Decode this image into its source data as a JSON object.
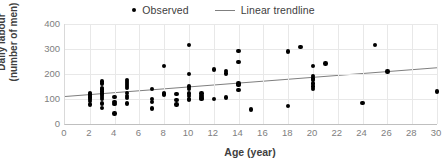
{
  "legend": {
    "position": "top-center",
    "entries": [
      {
        "label": "Observed",
        "marker": "dot-marker-icon",
        "color": "#000000"
      },
      {
        "label": "Linear trendline",
        "marker": "line-marker-icon",
        "color": "#7f7f7f"
      }
    ]
  },
  "axis_titles": {
    "y_line1": "Daily labour",
    "y_line2": "(number of men)",
    "x": "Age (year)"
  },
  "chart_data": {
    "type": "scatter",
    "title": "",
    "xlabel": "Age (year)",
    "ylabel": "Daily labour (number of men)",
    "xlim": [
      0,
      30
    ],
    "ylim": [
      0,
      400
    ],
    "xticks": [
      0,
      2,
      4,
      6,
      8,
      10,
      12,
      14,
      16,
      18,
      20,
      22,
      24,
      26,
      28,
      30
    ],
    "yticks": [
      0,
      100,
      200,
      300,
      400
    ],
    "grid": true,
    "grid_color": "#e8e8e8",
    "series": [
      {
        "name": "Observed",
        "type": "scatter",
        "color": "#000000",
        "points": [
          [
            2,
            125
          ],
          [
            2,
            118
          ],
          [
            2,
            112
          ],
          [
            2,
            106
          ],
          [
            2,
            100
          ],
          [
            2,
            92
          ],
          [
            2,
            78
          ],
          [
            3,
            170
          ],
          [
            3,
            162
          ],
          [
            3,
            145
          ],
          [
            3,
            138
          ],
          [
            3,
            130
          ],
          [
            3,
            122
          ],
          [
            3,
            115
          ],
          [
            3,
            108
          ],
          [
            3,
            100
          ],
          [
            3,
            82
          ],
          [
            3,
            65
          ],
          [
            4,
            108
          ],
          [
            4,
            88
          ],
          [
            4,
            80
          ],
          [
            4,
            42
          ],
          [
            5,
            175
          ],
          [
            5,
            168
          ],
          [
            5,
            160
          ],
          [
            5,
            152
          ],
          [
            5,
            145
          ],
          [
            5,
            125
          ],
          [
            5,
            112
          ],
          [
            5,
            105
          ],
          [
            5,
            82
          ],
          [
            7,
            140
          ],
          [
            7,
            100
          ],
          [
            7,
            88
          ],
          [
            7,
            62
          ],
          [
            8,
            232
          ],
          [
            8,
            122
          ],
          [
            8,
            118
          ],
          [
            9,
            120
          ],
          [
            9,
            95
          ],
          [
            9,
            78
          ],
          [
            10,
            315
          ],
          [
            10,
            200
          ],
          [
            10,
            150
          ],
          [
            10,
            140
          ],
          [
            10,
            122
          ],
          [
            10,
            112
          ],
          [
            10,
            100
          ],
          [
            10,
            95
          ],
          [
            11,
            122
          ],
          [
            11,
            112
          ],
          [
            11,
            105
          ],
          [
            11,
            100
          ],
          [
            12,
            218
          ],
          [
            12,
            100
          ],
          [
            13,
            212
          ],
          [
            13,
            202
          ],
          [
            13,
            106
          ],
          [
            14,
            292
          ],
          [
            14,
            248
          ],
          [
            14,
            162
          ],
          [
            14,
            155
          ],
          [
            14,
            135
          ],
          [
            15,
            58
          ],
          [
            18,
            290
          ],
          [
            18,
            72
          ],
          [
            19,
            308
          ],
          [
            20,
            232
          ],
          [
            20,
            192
          ],
          [
            20,
            182
          ],
          [
            20,
            175
          ],
          [
            20,
            162
          ],
          [
            20,
            150
          ],
          [
            20,
            140
          ],
          [
            21,
            242
          ],
          [
            24,
            85
          ],
          [
            25,
            315
          ],
          [
            26,
            210
          ],
          [
            30,
            130
          ]
        ]
      },
      {
        "name": "Linear trendline",
        "type": "line",
        "color": "#7f7f7f",
        "endpoints": [
          [
            0,
            110
          ],
          [
            30,
            225
          ]
        ]
      }
    ]
  }
}
